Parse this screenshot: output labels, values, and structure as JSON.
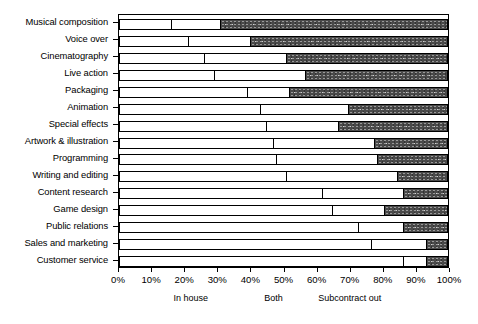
{
  "chart_data": {
    "type": "bar",
    "subtype": "horizontal-stacked-100",
    "title": "",
    "xlabel": "",
    "ylabel": "",
    "xlim": [
      0,
      100
    ],
    "grid": false,
    "legend_position": "bottom",
    "categories": [
      "Musical composition",
      "Voice over",
      "Cinematography",
      "Live action",
      "Packaging",
      "Animation",
      "Special effects",
      "Artwork & illustration",
      "Programming",
      "Writing and editing",
      "Content research",
      "Game design",
      "Public relations",
      "Sales and marketing",
      "Customer service"
    ],
    "series": [
      {
        "name": "In house",
        "values": [
          16,
          21,
          26,
          29,
          39,
          43,
          45,
          47,
          48,
          51,
          62,
          65,
          73,
          77,
          87
        ]
      },
      {
        "name": "Both",
        "values": [
          15,
          19,
          25,
          28,
          13,
          27,
          22,
          31,
          31,
          34,
          25,
          16,
          14,
          17,
          7
        ]
      },
      {
        "name": "Subcontract out",
        "values": [
          69,
          60,
          49,
          43,
          48,
          30,
          33,
          22,
          21,
          15,
          13,
          19,
          13,
          6,
          6
        ]
      }
    ],
    "xticks": [
      0,
      10,
      20,
      30,
      40,
      50,
      60,
      70,
      80,
      90,
      100
    ],
    "xticklabels": [
      "0%",
      "10%",
      "20%",
      "30%",
      "40%",
      "50%",
      "60%",
      "70%",
      "80%",
      "90%",
      "100%"
    ],
    "legend": [
      {
        "label": "In house",
        "at_percent": 22
      },
      {
        "label": "Both",
        "at_percent": 47
      },
      {
        "label": "Subcontract out",
        "at_percent": 70
      }
    ],
    "colors": {
      "in_house": "#ffffff",
      "both": "#ffffff",
      "subcontract_out": "#4a4a4a",
      "outline": "#000000"
    }
  }
}
